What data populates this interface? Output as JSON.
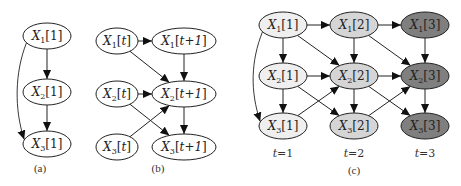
{
  "colors": {
    "stroke": "#222222",
    "fill_default": "#ffffff",
    "fill_t1": "#efefef",
    "fill_t2": "#d5d5d5",
    "fill_t3": "#7f7f7f"
  },
  "panels": [
    {
      "id": "a",
      "caption": "(a)",
      "caption_pos": [
        40,
        172
      ],
      "nodes": [
        {
          "id": "a_x1",
          "var": "X",
          "sub": "1",
          "idx": "1",
          "cx": 47,
          "cy": 36,
          "rx": 24,
          "ry": 13,
          "fill": "fill_default"
        },
        {
          "id": "a_x2",
          "var": "X",
          "sub": "2",
          "idx": "1",
          "cx": 47,
          "cy": 92,
          "rx": 24,
          "ry": 13,
          "fill": "fill_default"
        },
        {
          "id": "a_x3",
          "var": "X",
          "sub": "3",
          "idx": "1",
          "cx": 47,
          "cy": 144,
          "rx": 24,
          "ry": 13,
          "fill": "fill_default"
        }
      ],
      "edges": [
        {
          "from": "a_x1",
          "to": "a_x2"
        },
        {
          "from": "a_x2",
          "to": "a_x3"
        },
        {
          "from": "a_x1",
          "to": "a_x3",
          "curve": "left"
        }
      ]
    },
    {
      "id": "b",
      "caption": "(b)",
      "caption_pos": [
        158,
        172
      ],
      "nodes": [
        {
          "id": "b_x1t",
          "var": "X",
          "sub": "1",
          "idx": "t",
          "cx": 117,
          "cy": 41,
          "rx": 21,
          "ry": 13,
          "fill": "fill_default"
        },
        {
          "id": "b_x2t",
          "var": "X",
          "sub": "2",
          "idx": "t",
          "cx": 117,
          "cy": 94,
          "rx": 21,
          "ry": 13,
          "fill": "fill_default"
        },
        {
          "id": "b_x3t",
          "var": "X",
          "sub": "3",
          "idx": "t",
          "cx": 117,
          "cy": 147,
          "rx": 21,
          "ry": 13,
          "fill": "fill_default"
        },
        {
          "id": "b_x1n",
          "var": "X",
          "sub": "1",
          "idx": "t+1",
          "cx": 184,
          "cy": 41,
          "rx": 32,
          "ry": 13,
          "fill": "fill_default"
        },
        {
          "id": "b_x2n",
          "var": "X",
          "sub": "2",
          "idx": "t+1",
          "cx": 184,
          "cy": 94,
          "rx": 32,
          "ry": 13,
          "fill": "fill_default"
        },
        {
          "id": "b_x3n",
          "var": "X",
          "sub": "3",
          "idx": "t+1",
          "cx": 184,
          "cy": 147,
          "rx": 32,
          "ry": 13,
          "fill": "fill_default"
        }
      ],
      "edges": [
        {
          "from": "b_x1t",
          "to": "b_x1n"
        },
        {
          "from": "b_x1t",
          "to": "b_x2n"
        },
        {
          "from": "b_x2t",
          "to": "b_x2n"
        },
        {
          "from": "b_x2t",
          "to": "b_x3n"
        },
        {
          "from": "b_x3t",
          "to": "b_x2n"
        },
        {
          "from": "b_x1n",
          "to": "b_x2n"
        },
        {
          "from": "b_x2n",
          "to": "b_x3n"
        }
      ]
    },
    {
      "id": "c",
      "caption": "(c)",
      "caption_pos": [
        354,
        174
      ],
      "time_labels": [
        {
          "var": "t",
          "eq": "=1",
          "x": 283,
          "y": 157
        },
        {
          "var": "t",
          "eq": "=2",
          "x": 354,
          "y": 157
        },
        {
          "var": "t",
          "eq": "=3",
          "x": 425,
          "y": 157
        }
      ],
      "nodes": [
        {
          "id": "c_x1_1",
          "var": "X",
          "sub": "1",
          "idx": "1",
          "cx": 283,
          "cy": 25,
          "rx": 24,
          "ry": 13,
          "fill": "fill_t1"
        },
        {
          "id": "c_x2_1",
          "var": "X",
          "sub": "2",
          "idx": "1",
          "cx": 283,
          "cy": 76,
          "rx": 24,
          "ry": 13,
          "fill": "fill_t1"
        },
        {
          "id": "c_x3_1",
          "var": "X",
          "sub": "3",
          "idx": "1",
          "cx": 283,
          "cy": 126,
          "rx": 24,
          "ry": 13,
          "fill": "fill_t1"
        },
        {
          "id": "c_x1_2",
          "var": "X",
          "sub": "1",
          "idx": "2",
          "cx": 354,
          "cy": 25,
          "rx": 24,
          "ry": 13,
          "fill": "fill_t2"
        },
        {
          "id": "c_x2_2",
          "var": "X",
          "sub": "2",
          "idx": "2",
          "cx": 354,
          "cy": 76,
          "rx": 24,
          "ry": 13,
          "fill": "fill_t2"
        },
        {
          "id": "c_x3_2",
          "var": "X",
          "sub": "3",
          "idx": "2",
          "cx": 354,
          "cy": 126,
          "rx": 24,
          "ry": 13,
          "fill": "fill_t2"
        },
        {
          "id": "c_x1_3",
          "var": "X",
          "sub": "1",
          "idx": "3",
          "cx": 425,
          "cy": 25,
          "rx": 24,
          "ry": 13,
          "fill": "fill_t3"
        },
        {
          "id": "c_x2_3",
          "var": "X",
          "sub": "2",
          "idx": "3",
          "cx": 425,
          "cy": 76,
          "rx": 24,
          "ry": 13,
          "fill": "fill_t3"
        },
        {
          "id": "c_x3_3",
          "var": "X",
          "sub": "3",
          "idx": "3",
          "cx": 425,
          "cy": 126,
          "rx": 24,
          "ry": 13,
          "fill": "fill_t3"
        }
      ],
      "edges": [
        {
          "from": "c_x1_1",
          "to": "c_x2_1"
        },
        {
          "from": "c_x2_1",
          "to": "c_x3_1"
        },
        {
          "from": "c_x1_1",
          "to": "c_x3_1",
          "curve": "left"
        },
        {
          "from": "c_x1_1",
          "to": "c_x1_2"
        },
        {
          "from": "c_x1_1",
          "to": "c_x2_2"
        },
        {
          "from": "c_x2_1",
          "to": "c_x2_2"
        },
        {
          "from": "c_x2_1",
          "to": "c_x3_2"
        },
        {
          "from": "c_x3_1",
          "to": "c_x2_2"
        },
        {
          "from": "c_x1_2",
          "to": "c_x2_2"
        },
        {
          "from": "c_x2_2",
          "to": "c_x3_2"
        },
        {
          "from": "c_x1_2",
          "to": "c_x1_3"
        },
        {
          "from": "c_x1_2",
          "to": "c_x2_3"
        },
        {
          "from": "c_x2_2",
          "to": "c_x2_3"
        },
        {
          "from": "c_x2_2",
          "to": "c_x3_3"
        },
        {
          "from": "c_x3_2",
          "to": "c_x2_3"
        },
        {
          "from": "c_x1_3",
          "to": "c_x2_3"
        },
        {
          "from": "c_x2_3",
          "to": "c_x3_3"
        }
      ]
    }
  ]
}
